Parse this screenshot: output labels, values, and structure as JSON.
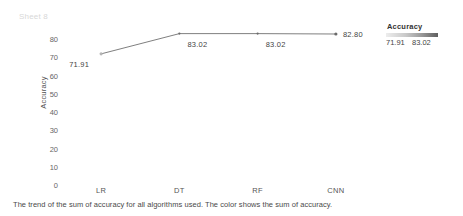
{
  "sheet": {
    "title": "Sheet 8"
  },
  "caption": "The trend of the sum of accuracy for all algorithms used. The color shows the sum of accuracy.",
  "legend": {
    "title": "Accuracy",
    "min_label": "71.91",
    "max_label": "83.02",
    "ramp_start_color": "#ededed",
    "ramp_end_color": "#5f5f5f"
  },
  "axis": {
    "y_title": "Accuracy",
    "y_ticks": [
      "80",
      "70",
      "60",
      "50",
      "40",
      "30",
      "20",
      "10",
      "0"
    ],
    "x_ticks": [
      "LR",
      "DT",
      "RF",
      "CNN"
    ]
  },
  "chart_data": {
    "type": "line",
    "title": "Sheet 8",
    "xlabel": "",
    "ylabel": "Accuracy",
    "categories": [
      "LR",
      "DT",
      "RF",
      "CNN"
    ],
    "values": [
      71.91,
      83.02,
      83.02,
      82.8
    ],
    "point_labels": [
      "71.91",
      "83.02",
      "83.02",
      "82.80"
    ],
    "ylim": [
      0,
      85
    ],
    "y_ticks": [
      0,
      10,
      20,
      30,
      40,
      50,
      60,
      70,
      80
    ],
    "grid": false,
    "legend_position": "right",
    "series": [
      {
        "name": "Accuracy",
        "values": [
          71.91,
          83.02,
          83.02,
          82.8
        ]
      }
    ],
    "line_color": "#707070",
    "marker": "circle"
  }
}
